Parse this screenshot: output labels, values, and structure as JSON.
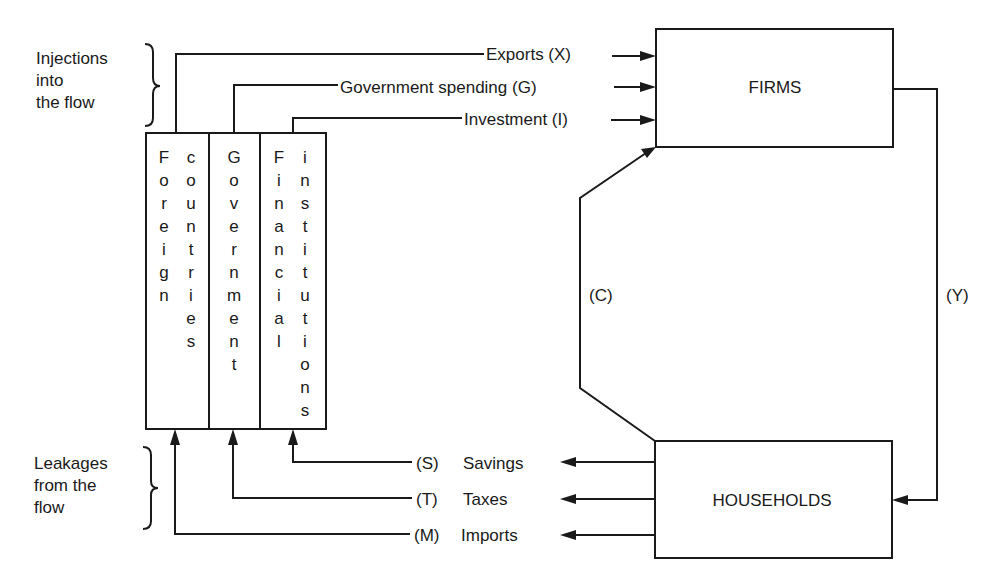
{
  "diagram": {
    "type": "circular-flow-of-income",
    "colors": {
      "ink": "#1a1a1a",
      "background": "#ffffff"
    },
    "side_labels": {
      "injections": [
        "Injections",
        "into",
        "the flow"
      ],
      "leakages": [
        "Leakages",
        "from the",
        "flow"
      ]
    },
    "sectors": {
      "firms": "FIRMS",
      "households": "HOUSEHOLDS"
    },
    "columns": [
      {
        "id": "foreign",
        "words": [
          "Foreign",
          "countries"
        ]
      },
      {
        "id": "government",
        "words": [
          "Government"
        ]
      },
      {
        "id": "financial",
        "words": [
          "Financial",
          "institutions"
        ]
      }
    ],
    "injections": [
      {
        "label": "Exports (X)",
        "from": "foreign"
      },
      {
        "label": "Government spending (G)",
        "from": "government"
      },
      {
        "label": "Investment (I)",
        "from": "financial"
      }
    ],
    "leakages": [
      {
        "code": "(S)",
        "label": "Savings",
        "to": "financial"
      },
      {
        "code": "(T)",
        "label": "Taxes",
        "to": "government"
      },
      {
        "code": "(M)",
        "label": "Imports",
        "to": "foreign"
      }
    ],
    "flows": {
      "consumption": "(C)",
      "income": "(Y)"
    }
  }
}
